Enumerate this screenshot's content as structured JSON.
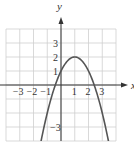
{
  "chart_data": {
    "type": "line",
    "title": "",
    "xlabel": "x",
    "ylabel": "y",
    "xlim": [
      -4,
      4
    ],
    "ylim": [
      -4,
      4
    ],
    "grid": true,
    "x_ticks": [
      {
        "value": -3,
        "label": "−3"
      },
      {
        "value": -2,
        "label": "−2"
      },
      {
        "value": -1,
        "label": "−1"
      },
      {
        "value": 1,
        "label": "1"
      },
      {
        "value": 2,
        "label": "2"
      },
      {
        "value": 3,
        "label": "3"
      }
    ],
    "y_ticks": [
      {
        "value": 3,
        "label": "3"
      },
      {
        "value": 2,
        "label": "2"
      },
      {
        "value": 1,
        "label": "1"
      },
      {
        "value": -3,
        "label": "−3"
      }
    ],
    "series": [
      {
        "name": "parabola",
        "equation": "y = -x^2 + 2x + 1",
        "vertex": [
          1,
          2
        ],
        "y_intercept": 1,
        "x_intercepts": [
          -0.41,
          2.41
        ],
        "x": [
          -1.7,
          -1.5,
          -1,
          -0.5,
          0,
          0.5,
          1,
          1.5,
          2,
          2.5,
          3,
          3.5,
          3.7
        ],
        "values": [
          -5.29,
          -4.25,
          -2,
          -0.25,
          1,
          1.75,
          2,
          1.75,
          1,
          -0.25,
          -2,
          -4.25,
          -5.29
        ]
      }
    ],
    "colors": {
      "curve": "#555555",
      "grid": "#cfcfcf",
      "axis": "#333333"
    }
  }
}
